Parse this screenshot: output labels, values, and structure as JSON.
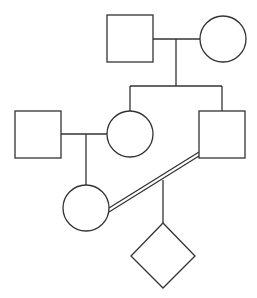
{
  "diagram": {
    "type": "pedigree",
    "individuals": [
      {
        "id": "gen1-male",
        "sex": "male",
        "shape": "square"
      },
      {
        "id": "gen1-female",
        "sex": "female",
        "shape": "circle"
      },
      {
        "id": "gen2-daughter",
        "sex": "female",
        "shape": "circle"
      },
      {
        "id": "gen2-son",
        "sex": "male",
        "shape": "square"
      },
      {
        "id": "gen2-spouse-male",
        "sex": "male",
        "shape": "square"
      },
      {
        "id": "gen3-female",
        "sex": "female",
        "shape": "circle"
      },
      {
        "id": "gen4-child",
        "sex": "unknown",
        "shape": "diamond"
      }
    ],
    "relationships": [
      {
        "partners": [
          "gen1-male",
          "gen1-female"
        ],
        "type": "mating",
        "children": [
          "gen2-daughter",
          "gen2-son"
        ]
      },
      {
        "partners": [
          "gen2-spouse-male",
          "gen2-daughter"
        ],
        "type": "mating",
        "children": [
          "gen3-female"
        ]
      },
      {
        "partners": [
          "gen3-female",
          "gen2-son"
        ],
        "type": "consanguineous",
        "children": [
          "gen4-child"
        ]
      }
    ],
    "colors": {
      "stroke": "#333333",
      "fill": "#ffffff"
    }
  }
}
